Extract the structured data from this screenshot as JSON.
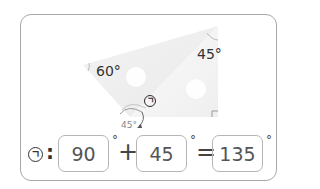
{
  "figure": {
    "angle_left": "60°",
    "angle_top": "45°",
    "angle_bottom_small": "45°",
    "marker_symbol": "ㄱ",
    "colors": {
      "ruler_fill": "#efefef",
      "outline": "#a8a8a8",
      "text": "#333333"
    }
  },
  "equation": {
    "label_symbol": "ㄱ",
    "colon": ":",
    "term1": "90",
    "degree1": "°",
    "operator_plus": "+",
    "term2": "45",
    "degree2": "°",
    "operator_equals": "=",
    "result": "135",
    "degree3": "°"
  }
}
